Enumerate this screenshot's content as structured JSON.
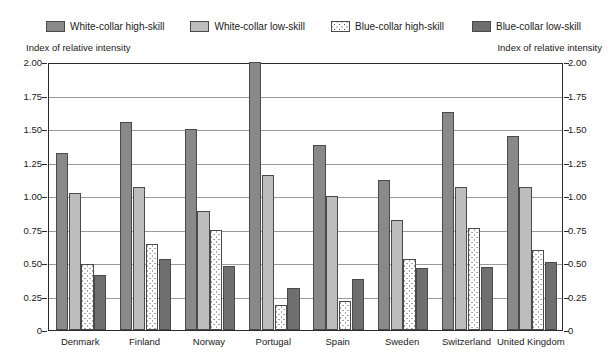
{
  "legend": {
    "items": [
      {
        "label": "White-collar high-skill",
        "key": "wc_high",
        "color": "#898989",
        "pattern": "solid"
      },
      {
        "label": "White-collar low-skill",
        "key": "wc_low",
        "color": "#bdbdbd",
        "pattern": "solid"
      },
      {
        "label": "Blue-collar high-skill",
        "key": "bc_high",
        "color": "#ffffff",
        "pattern": "dotted"
      },
      {
        "label": "Blue-collar low-skill",
        "key": "bc_low",
        "color": "#6f6f6f",
        "pattern": "solid"
      }
    ]
  },
  "axis": {
    "left_caption": "Index of relative intensity",
    "right_caption": "Index of relative intensity",
    "ticks": [
      "2.00",
      "1.75",
      "1.50",
      "1.25",
      "1.00",
      "0.75",
      "0.50",
      "0.25",
      "0"
    ]
  },
  "chart_data": {
    "type": "bar",
    "title": "",
    "xlabel": "",
    "ylabel": "Index of relative intensity",
    "ylim": [
      0,
      2.0
    ],
    "ytick_values": [
      2.0,
      1.75,
      1.5,
      1.25,
      1.0,
      0.75,
      0.5,
      0.25,
      0
    ],
    "grid": true,
    "legend_position": "top",
    "categories": [
      "Denmark",
      "Finland",
      "Norway",
      "Portugal",
      "Spain",
      "Sweden",
      "Switzerland",
      "United Kingdom"
    ],
    "series": [
      {
        "name": "White-collar high-skill",
        "values": [
          1.32,
          1.55,
          1.5,
          2.0,
          1.38,
          1.12,
          1.63,
          1.45
        ]
      },
      {
        "name": "White-collar low-skill",
        "values": [
          1.02,
          1.07,
          0.89,
          1.16,
          1.0,
          0.82,
          1.07,
          1.07
        ]
      },
      {
        "name": "Blue-collar high-skill",
        "values": [
          0.49,
          0.64,
          0.75,
          0.19,
          0.22,
          0.53,
          0.76,
          0.6
        ]
      },
      {
        "name": "Blue-collar low-skill",
        "values": [
          0.41,
          0.53,
          0.48,
          0.31,
          0.38,
          0.46,
          0.47,
          0.51
        ]
      }
    ]
  }
}
